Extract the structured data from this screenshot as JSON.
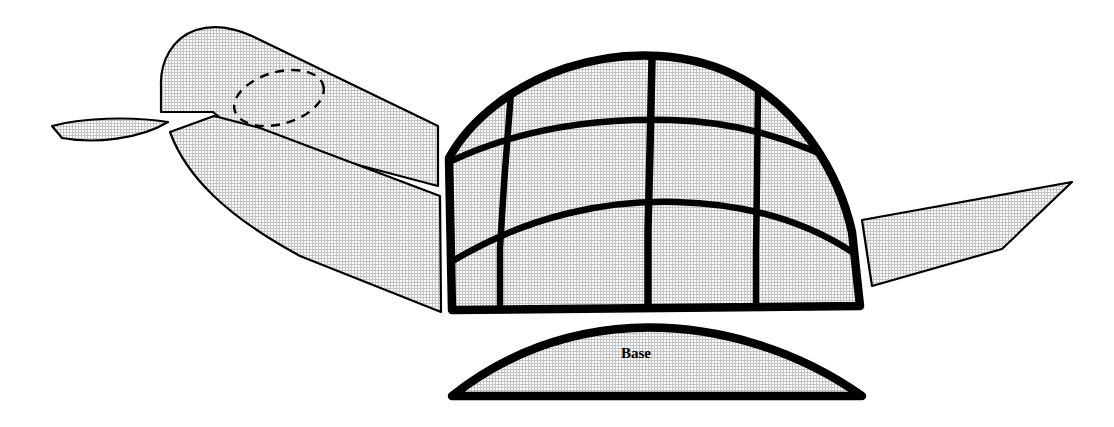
{
  "document": {
    "title": "Turtle Pattern Diagram",
    "background_color": "#ffffff",
    "ink_color": "#000000",
    "fill_texture": "halftone-grid",
    "fill_tint": "#c8c8c8"
  },
  "labels": {
    "base": "Base"
  },
  "pieces": [
    {
      "id": "beak",
      "name": "beak-piece",
      "label": ""
    },
    {
      "id": "head",
      "name": "head-piece",
      "label": ""
    },
    {
      "id": "eye-guide",
      "name": "eye-dashed-guide",
      "label": ""
    },
    {
      "id": "front-flipper",
      "name": "front-flipper-piece",
      "label": ""
    },
    {
      "id": "shell",
      "name": "shell-piece",
      "label": ""
    },
    {
      "id": "rear-flipper",
      "name": "rear-flipper-piece",
      "label": ""
    },
    {
      "id": "base",
      "name": "base-piece",
      "label": "Base"
    }
  ],
  "shell": {
    "panel_count": 11,
    "vertical_seam_count": 3,
    "horizontal_seam_count": 2
  }
}
